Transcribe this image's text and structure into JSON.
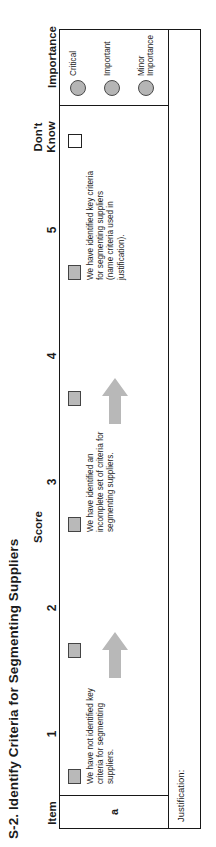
{
  "title": "S-2. Identify Criteria for Segmenting Suppliers",
  "header": {
    "item_label": "Item",
    "score_group_label": "Score",
    "score_labels": [
      "1",
      "2",
      "3",
      "4",
      "5"
    ],
    "dont_know_line1": "Don't",
    "dont_know_line2": "Know",
    "importance_label": "Importance"
  },
  "rows": [
    {
      "item": "a",
      "descriptions": [
        {
          "score": "1",
          "text": "We have not identified key criteria for segmenting suppliers."
        },
        {
          "score": "3",
          "text": "We have identified an incomplete set of criteria for segmenting suppliers."
        },
        {
          "score": "5",
          "text": "We have identified key criteria for segmenting suppliers (name criteria used in justification)."
        }
      ],
      "checkboxes": [
        "1",
        "2",
        "3",
        "4",
        "5"
      ],
      "dont_know_checkbox": "Don't Know"
    }
  ],
  "importance_options": [
    {
      "label": "Critical"
    },
    {
      "label": "Important"
    },
    {
      "label": "Minor\nImportance"
    }
  ],
  "justification": {
    "label": "Justification:",
    "value": ""
  },
  "colors": {
    "checkbox_fill": "#b9b9b9",
    "checkbox_border": "#444444",
    "circle_fill": "#b5b5b5",
    "circle_border": "#4a4a4a",
    "arrow_fill": "#b8b8b8",
    "table_border": "#171717",
    "text": "#1b1b1b"
  }
}
